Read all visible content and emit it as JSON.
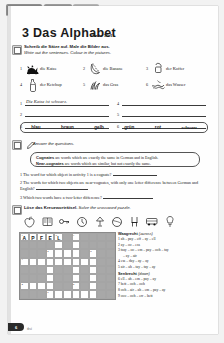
{
  "tabs": [
    {
      "label": "Kompetenz 1",
      "name": "tab-unit"
    },
    {
      "label": "Vokabeln",
      "name": "tab-vocab"
    },
    {
      "label": "",
      "name": "tab-blank"
    }
  ],
  "header": {
    "number": "3",
    "title": "Das Alphabet",
    "reference": "Seite 10-11"
  },
  "exercise_a": {
    "badge": "A",
    "instruction_de": "Schreib die Sätze auf. Male die Bilder aus.",
    "instruction_en": "Write out the sentences. Colour in the pictures.",
    "items": [
      {
        "num": "1",
        "word": "die Katze",
        "icon": "cat-icon"
      },
      {
        "num": "2",
        "word": "die Banane",
        "icon": "banana-icon"
      },
      {
        "num": "3",
        "word": "der Koffer",
        "icon": "suitcase-icon"
      },
      {
        "num": "4",
        "word": "der Ketchup",
        "icon": "ketchup-bottle-icon"
      },
      {
        "num": "5",
        "word": "das Gras",
        "icon": "grass-icon"
      },
      {
        "num": "6",
        "word": "das Wasser",
        "icon": "water-icon"
      }
    ],
    "answers": [
      {
        "num": "1",
        "value": "Die Katze ist schwarz."
      },
      {
        "num": "4",
        "value": ""
      },
      {
        "num": "2",
        "value": ""
      },
      {
        "num": "5",
        "value": ""
      },
      {
        "num": "3",
        "value": ""
      },
      {
        "num": "6",
        "value": ""
      }
    ],
    "wordbank": [
      "blau",
      "braun",
      "gelb",
      "grün",
      "rot",
      "schwarz"
    ]
  },
  "exercise_b": {
    "badge": "B",
    "instruction_en": "Answer the questions.",
    "infobox": {
      "line1_bold": "Cognates",
      "line1_rest": " are words which are exactly the same in German and in English.",
      "line2_bold": "Near-cognates",
      "line2_rest": " are words which are similar, but not exactly the same."
    },
    "questions": [
      "1 The word for which object in activity 1 is a cognate?",
      "2 The words for which two objects are near-cognates, with only one letter difference between German and English?",
      "3 Which two words have a two-letter difference?"
    ]
  },
  "exercise_c": {
    "badge": "C",
    "instruction_de": "Löse das Kreuzworträtsel.",
    "instruction_en": "Solve the crossword puzzle.",
    "icons": [
      "apple-icon",
      "book-icon",
      "key-icon",
      "clock-icon",
      "lamp-icon",
      "ball-icon",
      "chair-icon",
      "bus-icon",
      "bulb-icon"
    ],
    "grid_letters": [
      "A",
      "P",
      "F",
      "E",
      "L"
    ],
    "across_heading_de": "Waagrecht",
    "across_heading_en": "(across)",
    "across": [
      "1 ah – pay – eff – ay – ell",
      "2 ay – oo – ess",
      "3 tsay – oo – em – pay – ooh – tay",
      "– ay – air",
      "4 ess – day – ay – ay",
      "5 air – ah – tay – tay – ay"
    ],
    "down_heading_de": "Senkrecht",
    "down_heading_en": "(down)",
    "down": [
      "6 ell – ah – em – pay – ay",
      "7 bett – ooh – ooh",
      "8 ooh – air – ah – em – pay – ay",
      "9 ooo – ooh – err – bett"
    ]
  },
  "footer": {
    "page": "6",
    "note": "drei"
  }
}
